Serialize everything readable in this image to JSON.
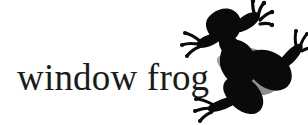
{
  "image": {
    "background_color": "#ffffff",
    "width": 308,
    "height": 125
  },
  "caption": {
    "text": "window frog",
    "color": "#1b1b1b",
    "style": "serif"
  },
  "figure": {
    "subject": "frog",
    "depiction": "frog-silhouette",
    "silhouette_color": "#0a0a0a",
    "shadow_color": "#8d8d8d",
    "pose": "climbing, viewed from above, limbs splayed with spread toes",
    "parts": [
      "head",
      "left-front-leg",
      "right-front-leg",
      "torso",
      "left-hind-leg",
      "right-hind-leg"
    ]
  }
}
